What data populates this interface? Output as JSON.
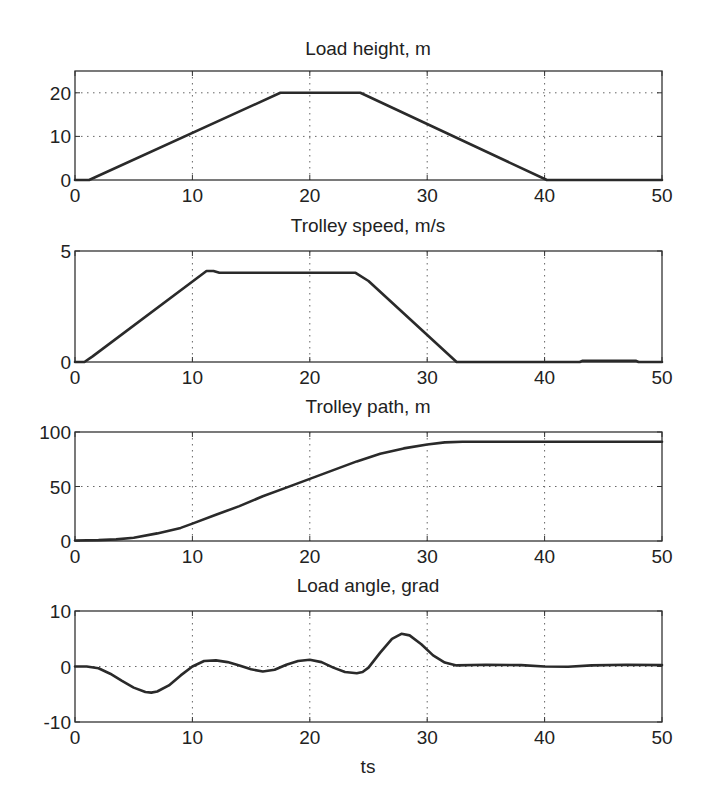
{
  "figure": {
    "background": "#ffffff",
    "line_color": "#2a2a2a",
    "axis_color": "#333333",
    "grid_color": "#666666"
  },
  "chart_data": [
    {
      "type": "line",
      "title": "Load height, m",
      "xlabel": "",
      "ylabel": "",
      "xlim": [
        0,
        50
      ],
      "ylim": [
        0,
        25
      ],
      "xticks": [
        0,
        10,
        20,
        30,
        40,
        50
      ],
      "yticks": [
        0,
        10,
        20
      ],
      "grid": true,
      "series": [
        {
          "name": "Load height",
          "x": [
            0,
            1.2,
            17.5,
            24.3,
            40.2,
            50
          ],
          "y": [
            0,
            0,
            20,
            20,
            0,
            0
          ]
        }
      ]
    },
    {
      "type": "line",
      "title": "Trolley speed, m/s",
      "xlabel": "",
      "ylabel": "",
      "xlim": [
        0,
        50
      ],
      "ylim": [
        0,
        5
      ],
      "xticks": [
        0,
        10,
        20,
        30,
        40,
        50
      ],
      "yticks": [
        0,
        5
      ],
      "grid": true,
      "series": [
        {
          "name": "Trolley speed",
          "x": [
            0,
            0.8,
            1.5,
            11.2,
            11.8,
            12.3,
            23.9,
            25,
            32.5,
            43,
            43.2,
            47.8,
            48,
            50
          ],
          "y": [
            0,
            0,
            0.25,
            4.1,
            4.1,
            4.02,
            4.02,
            3.65,
            0,
            0,
            0.05,
            0.05,
            0,
            0
          ]
        }
      ]
    },
    {
      "type": "line",
      "title": "Trolley path, m",
      "xlabel": "",
      "ylabel": "",
      "xlim": [
        0,
        50
      ],
      "ylim": [
        0,
        100
      ],
      "xticks": [
        0,
        10,
        20,
        30,
        40,
        50
      ],
      "yticks": [
        0,
        50,
        100
      ],
      "grid": true,
      "series": [
        {
          "name": "Trolley path",
          "x": [
            0,
            2,
            3.5,
            5,
            7,
            9,
            10,
            12,
            14,
            16,
            18,
            20,
            22,
            24,
            26,
            28,
            30,
            31.5,
            33,
            40,
            50
          ],
          "y": [
            0.5,
            0.8,
            1.5,
            3,
            7,
            12,
            16,
            24,
            32,
            41,
            49,
            57,
            65,
            73,
            80,
            85,
            88.5,
            90.5,
            91,
            91,
            91
          ]
        }
      ]
    },
    {
      "type": "line",
      "title": "Load angle, grad",
      "xlabel": "ts",
      "ylabel": "",
      "xlim": [
        0,
        50
      ],
      "ylim": [
        -10,
        10
      ],
      "xticks": [
        0,
        10,
        20,
        30,
        40,
        50
      ],
      "yticks": [
        -10,
        0,
        10
      ],
      "grid": true,
      "series": [
        {
          "name": "Load angle",
          "x": [
            0,
            1,
            2,
            3,
            4,
            5,
            6,
            6.5,
            7,
            8,
            9,
            10,
            11,
            12,
            13,
            14,
            15,
            16,
            17,
            18,
            19,
            20,
            21,
            22,
            23,
            24,
            24.5,
            25,
            26,
            27,
            27.8,
            28.5,
            29.5,
            30.5,
            31.5,
            32.5,
            35,
            38,
            40,
            42,
            44,
            47,
            50
          ],
          "y": [
            0,
            0,
            -0.3,
            -1.3,
            -2.6,
            -3.8,
            -4.6,
            -4.7,
            -4.5,
            -3.4,
            -1.6,
            0,
            1.0,
            1.1,
            0.8,
            0.2,
            -0.5,
            -0.9,
            -0.6,
            0.3,
            1.0,
            1.2,
            0.8,
            -0.2,
            -1.0,
            -1.2,
            -1.0,
            -0.2,
            2.5,
            5.0,
            5.9,
            5.6,
            4.0,
            2.0,
            0.7,
            0.2,
            0.3,
            0.25,
            0.0,
            -0.05,
            0.2,
            0.3,
            0.25
          ]
        }
      ]
    }
  ]
}
